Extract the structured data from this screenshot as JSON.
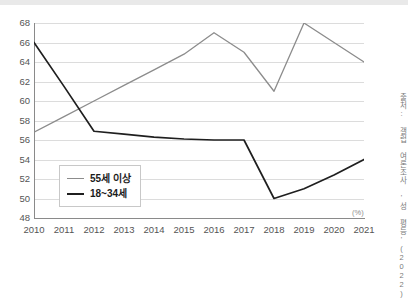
{
  "chart_data": {
    "type": "line",
    "title": "",
    "subtitle": "",
    "xlabel": "",
    "ylabel": "",
    "unit_label": "(%)",
    "source_note": "출처: 갤럽 여론조사 '성 평등'(2022)",
    "grid": "horizontal",
    "legend_position": "inside-bottom-left",
    "ylim": [
      48,
      68
    ],
    "yticks": [
      48,
      50,
      52,
      54,
      56,
      58,
      60,
      62,
      64,
      66,
      68
    ],
    "categories": [
      "2010",
      "2011",
      "2012",
      "2013",
      "2014",
      "2015",
      "2016",
      "2017",
      "2018",
      "2019",
      "2020",
      "2021"
    ],
    "series": [
      {
        "name": "55세 이상",
        "color": "#8c8c8c",
        "values": [
          56.8,
          58.4,
          60.0,
          61.6,
          63.2,
          64.8,
          67.0,
          65.0,
          61.0,
          68.0,
          66.0,
          64.0
        ]
      },
      {
        "name": "18~34세",
        "color": "#1f1f1f",
        "values": [
          66.0,
          61.5,
          56.9,
          56.6,
          56.3,
          56.1,
          56.0,
          56.0,
          50.0,
          51.0,
          52.4,
          54.0
        ]
      }
    ]
  }
}
